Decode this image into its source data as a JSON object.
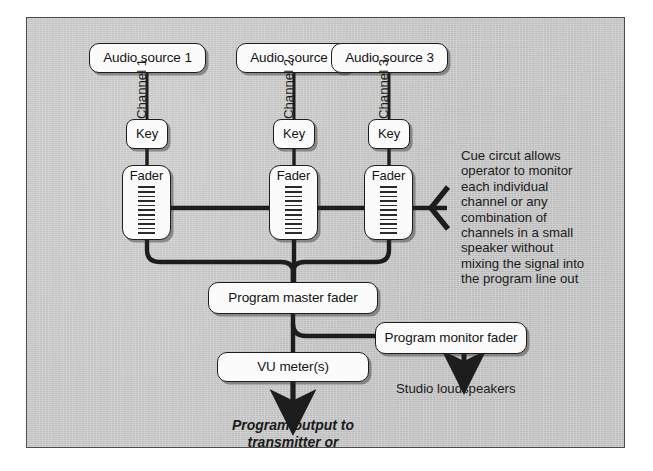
{
  "diagram": {
    "panel_color": "#c9c9c9",
    "line_color": "#1d1d1d",
    "node_fill": "#fbfbfb",
    "sources": [
      {
        "label": "Audio source 1",
        "channel": "Channel 1",
        "key": "Key",
        "fader": "Fader"
      },
      {
        "label": "Audio source 2",
        "channel": "Channel 2",
        "key": "Key",
        "fader": "Fader"
      },
      {
        "label": "Audio source 3",
        "channel": "Channel 3",
        "key": "Key",
        "fader": "Fader"
      }
    ],
    "master_fader": "Program master fader",
    "vu_meter": "VU meter(s)",
    "monitor_fader": "Program monitor fader",
    "loudspeakers": "Studio loudspeakers",
    "program_output": "Program output to\ntransmitter or\nrecorder",
    "cue_note": "Cue circut allows\noperator to monitor\neach individual\nchannel or any\ncombination of\nchannels in a small\nspeaker without\nmixing the signal into\nthe program line out",
    "fader_tick_count": 11
  }
}
